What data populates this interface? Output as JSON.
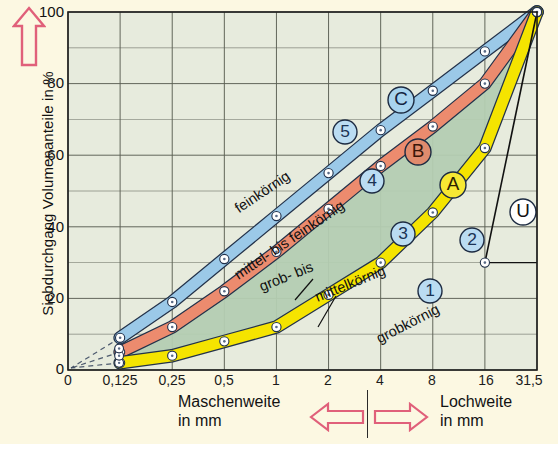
{
  "chart_data": {
    "type": "line",
    "title": "",
    "xlabel_left": "Maschenweite in mm",
    "xlabel_right": "Lochweite in mm",
    "ylabel": "Siebdurchgang Volumenanteile in %",
    "x_ticks": [
      "0",
      "0,125",
      "0,25",
      "0,5",
      "1",
      "2",
      "4",
      "8",
      "16",
      "31,5"
    ],
    "y_ticks": [
      "0",
      "20",
      "40",
      "60",
      "80",
      "100"
    ],
    "ylim": [
      0,
      100
    ],
    "grid": true,
    "legend": "none",
    "series": [
      {
        "name": "A",
        "color": "#f5e400",
        "label": "grobkörnig",
        "points": [
          [
            1,
            2
          ],
          [
            2,
            4
          ],
          [
            3,
            8
          ],
          [
            4,
            12
          ],
          [
            5,
            21
          ],
          [
            6,
            30
          ],
          [
            7,
            44
          ],
          [
            8,
            62
          ],
          [
            9,
            100
          ]
        ]
      },
      {
        "name": "B",
        "color": "#ec8b6e",
        "label": "mittel- bis feinkörnig",
        "points": [
          [
            1,
            5
          ],
          [
            2,
            12
          ],
          [
            3,
            22
          ],
          [
            4,
            33
          ],
          [
            5,
            45
          ],
          [
            6,
            57
          ],
          [
            7,
            68
          ],
          [
            8,
            80
          ],
          [
            9,
            100
          ]
        ]
      },
      {
        "name": "C",
        "color": "#9bc9e8",
        "label": "feinkörnig",
        "points": [
          [
            1,
            9
          ],
          [
            2,
            19
          ],
          [
            3,
            31
          ],
          [
            4,
            43
          ],
          [
            5,
            55
          ],
          [
            6,
            67
          ],
          [
            7,
            78
          ],
          [
            8,
            89
          ],
          [
            9,
            100
          ]
        ]
      },
      {
        "name": "U",
        "color": "#111111",
        "label": "U",
        "points": [
          [
            8,
            30
          ],
          [
            9,
            100
          ]
        ]
      }
    ],
    "band_labels": [
      {
        "text": "feinkörnig",
        "x": 265,
        "y": 196,
        "rot": -34
      },
      {
        "text": "mittel- bis feinkörnig",
        "x": 292,
        "y": 244,
        "rot": -34
      },
      {
        "text": "grob- bis",
        "x": 288,
        "y": 281,
        "rot": -22
      },
      {
        "text": "mittelkörnig",
        "x": 352,
        "y": 288,
        "rot": -22
      },
      {
        "text": "grobkörnig",
        "x": 410,
        "y": 328,
        "rot": -27
      }
    ],
    "markers": [
      {
        "label": "C",
        "x": 401,
        "y": 100,
        "fill": "#a8d4ef",
        "text": "#14233f",
        "r": 13
      },
      {
        "label": "B",
        "x": 418,
        "y": 152,
        "fill": "#e08b6d",
        "text": "#3a1508",
        "r": 13
      },
      {
        "label": "A",
        "x": 453,
        "y": 185,
        "fill": "#f7e833",
        "text": "#2a2200",
        "r": 13
      },
      {
        "label": "U",
        "x": 523,
        "y": 212,
        "fill": "#ffffff",
        "text": "#111111",
        "r": 13
      },
      {
        "label": "5",
        "x": 345,
        "y": 132,
        "fill": "#badcf2",
        "text": "#1b3354",
        "r": 12
      },
      {
        "label": "4",
        "x": 372,
        "y": 181,
        "fill": "#badcf2",
        "text": "#1b3354",
        "r": 12
      },
      {
        "label": "3",
        "x": 403,
        "y": 234,
        "fill": "#badcf2",
        "text": "#1b3354",
        "r": 12
      },
      {
        "label": "2",
        "x": 472,
        "y": 240,
        "fill": "#badcf2",
        "text": "#1b3354",
        "r": 12
      },
      {
        "label": "1",
        "x": 430,
        "y": 291,
        "fill": "#badcf2",
        "text": "#1b3354",
        "r": 12
      }
    ],
    "colors": {
      "plot_background": "#e7ebdd",
      "page_background": "#fcf8e2",
      "grid": "#5c6054",
      "green_region": "#b4cdb2",
      "arrow_outline": "#e0607a"
    }
  },
  "axis": {
    "arrow_up_name": "up-arrow",
    "arrow_left_name": "left-arrow",
    "arrow_right_name": "right-arrow"
  }
}
